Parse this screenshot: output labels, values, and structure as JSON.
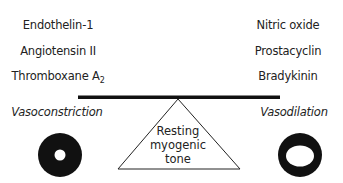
{
  "left_factors": [
    "Endothelin-1",
    "Angiotensin II",
    "Thromboxane A",
    "2"
  ],
  "vasoconstrictors": {
    "items": [
      "Endothelin-1",
      "Angiotensin II",
      "Thromboxane A"
    ],
    "subscript": "2"
  },
  "vasodilators": {
    "items": [
      "Nitric oxide",
      "Prostacyclin",
      "Bradykinin"
    ]
  },
  "labels": {
    "left": "Vasoconstriction",
    "right": "Vasodilation",
    "fulcrum_line1": "Resting",
    "fulcrum_line2": "myogenic",
    "fulcrum_line3": "tone"
  },
  "colors": {
    "ink": "#111111",
    "background": "#ffffff"
  }
}
